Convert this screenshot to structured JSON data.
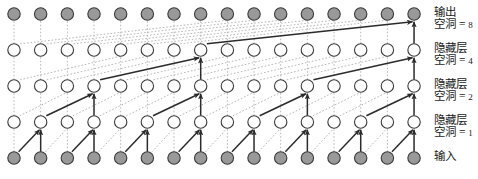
{
  "figure": {
    "kind": "dilated-causal-convolution-diagram",
    "time_steps": 16,
    "colors": {
      "node_fill_io": "#999999",
      "node_fill_hidden": "#ffffff",
      "node_stroke": "#3a3a3a",
      "edge_inactive": "#b8b8b8",
      "edge_active": "#2b2b2b",
      "text": "#1a1a1a",
      "background": "#ffffff"
    }
  },
  "layers": [
    {
      "id": "output",
      "row": 0,
      "y": 14,
      "name": "输出",
      "dilation_label": "空洞 = ",
      "dilation_value": "8",
      "dilation": 8,
      "node_fill": "io"
    },
    {
      "id": "hidden-4",
      "row": 1,
      "y": 50,
      "name": "隐藏层",
      "dilation_label": "空洞 = ",
      "dilation_value": "4",
      "dilation": 4,
      "node_fill": "hidden"
    },
    {
      "id": "hidden-2",
      "row": 2,
      "y": 86,
      "name": "隐藏层",
      "dilation_label": "空洞 = ",
      "dilation_value": "2",
      "dilation": 2,
      "node_fill": "hidden"
    },
    {
      "id": "hidden-1",
      "row": 3,
      "y": 122,
      "name": "隐藏层",
      "dilation_label": "空洞 = ",
      "dilation_value": "1",
      "dilation": 1,
      "node_fill": "hidden"
    },
    {
      "id": "input",
      "row": 4,
      "y": 158,
      "name": "输入",
      "dilation_label": "",
      "dilation_value": "",
      "dilation": 0,
      "node_fill": "io"
    }
  ],
  "chart_data": {
    "type": "diagram",
    "title": "",
    "time_steps": 16,
    "x_start": 14,
    "x_step": 26.67,
    "node_radius": 6.2,
    "rows_y": [
      14,
      50,
      86,
      122,
      158
    ],
    "dilations_bottom_up": [
      1,
      2,
      4,
      8
    ],
    "receptive_field": 16,
    "active_nodes": {
      "input": [
        0,
        1,
        2,
        3,
        4,
        5,
        6,
        7,
        8,
        9,
        10,
        11,
        12,
        13,
        14,
        15
      ],
      "hidden-1": [
        1,
        3,
        5,
        7,
        9,
        11,
        13,
        15
      ],
      "hidden-2": [
        3,
        7,
        11,
        15
      ],
      "hidden-4": [
        7,
        15
      ],
      "output": [
        15
      ]
    }
  }
}
